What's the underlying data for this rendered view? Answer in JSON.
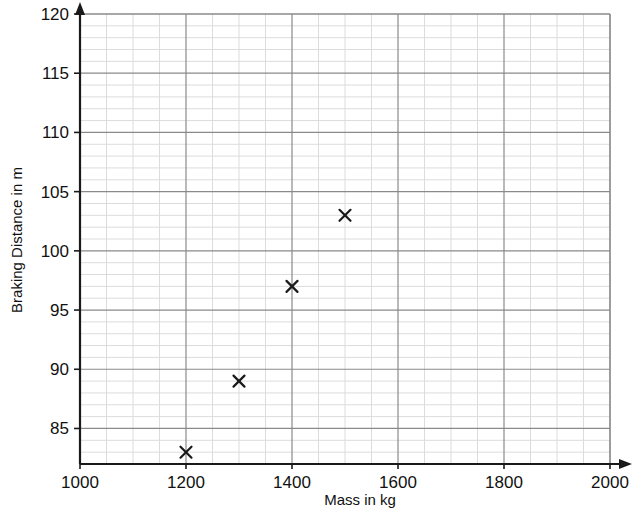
{
  "chart_data": {
    "type": "scatter",
    "title": "",
    "xlabel": "Mass in kg",
    "ylabel": "Braking Distance in m",
    "xlim": [
      1000,
      2000
    ],
    "ylim": [
      82,
      120
    ],
    "x_major_step": 200,
    "x_minor_step": 50,
    "y_major_step": 5,
    "y_minor_step": 1,
    "grid": "major and minor",
    "legend": "none",
    "marker": "x-cross",
    "xticks": [
      "1000",
      "1200",
      "1400",
      "1600",
      "1800",
      "2000"
    ],
    "xtick_values": [
      1000,
      1200,
      1400,
      1600,
      1800,
      2000
    ],
    "yticks": [
      "85",
      "90",
      "95",
      "100",
      "105",
      "110",
      "115",
      "120"
    ],
    "ytick_values": [
      85,
      90,
      95,
      100,
      105,
      110,
      115,
      120
    ],
    "points": [
      {
        "x": 1200,
        "y": 83
      },
      {
        "x": 1300,
        "y": 89
      },
      {
        "x": 1400,
        "y": 97
      },
      {
        "x": 1500,
        "y": 103
      }
    ],
    "x": [
      1200,
      1300,
      1400,
      1500
    ],
    "values": [
      83,
      89,
      97,
      103
    ]
  },
  "colors": {
    "background": "#ffffff",
    "axis": "#1a1a1a",
    "major_grid": "#8a8a8a",
    "minor_grid": "#dcdcdc",
    "marker": "#1a1a1a",
    "text": "#111111"
  }
}
